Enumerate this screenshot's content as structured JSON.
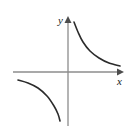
{
  "figure": {
    "title": "",
    "width": 136,
    "height": 132,
    "background_color": "#ffffff"
  },
  "axes": {
    "x_label": "x",
    "y_label": "y",
    "axis_color": "#8c8c8c",
    "arrow_color": "#4d4d4d",
    "label_color": "#1a1a1a",
    "origin": {
      "x": 68,
      "y": 72
    },
    "x_axis": {
      "start_x": 13,
      "end_x": 122,
      "y": 72,
      "arrow": "right"
    },
    "y_axis": {
      "x": 68,
      "start_y": 125,
      "end_y": 18,
      "arrow": "up"
    },
    "tick_labels": [],
    "gridlines": false
  },
  "chart_data": {
    "type": "line",
    "title": "",
    "subtitle": "",
    "xlabel": "x",
    "ylabel": "y",
    "xlim": [
      -5.5,
      5.4
    ],
    "ylim": [
      -5.3,
      5.4
    ],
    "grid": false,
    "legend": "none",
    "curve_color": "#2b2b2b",
    "curve_width": 1.6,
    "annotations": [],
    "series": [
      {
        "name": "branch-quadrant-I",
        "equation": "y = 1/x",
        "x": [
          0.3,
          0.4,
          0.5,
          0.7,
          0.9,
          1.2,
          1.5,
          2.0,
          2.6,
          3.2,
          4.0,
          5.0
        ],
        "y": [
          3.33,
          2.5,
          2.0,
          1.43,
          1.11,
          0.83,
          0.67,
          0.5,
          0.38,
          0.31,
          0.25,
          0.2
        ],
        "pixel_path": [
          [
            74,
            22
          ],
          [
            78,
            32
          ],
          [
            83,
            42
          ],
          [
            90,
            51
          ],
          [
            99,
            58
          ],
          [
            109,
            63
          ],
          [
            120,
            66
          ]
        ]
      },
      {
        "name": "branch-quadrant-III",
        "equation": "y = 1/x",
        "x": [
          -5.0,
          -4.0,
          -3.2,
          -2.6,
          -2.0,
          -1.5,
          -1.2,
          -0.9,
          -0.7,
          -0.55,
          -0.45
        ],
        "y": [
          -0.2,
          -0.25,
          -0.31,
          -0.38,
          -0.5,
          -0.67,
          -0.83,
          -1.11,
          -1.43,
          -1.82,
          -2.22
        ],
        "pixel_path": [
          [
            18,
            80
          ],
          [
            28,
            83
          ],
          [
            38,
            88
          ],
          [
            47,
            96
          ],
          [
            54,
            106
          ],
          [
            58,
            114
          ],
          [
            60,
            121
          ]
        ]
      }
    ]
  }
}
